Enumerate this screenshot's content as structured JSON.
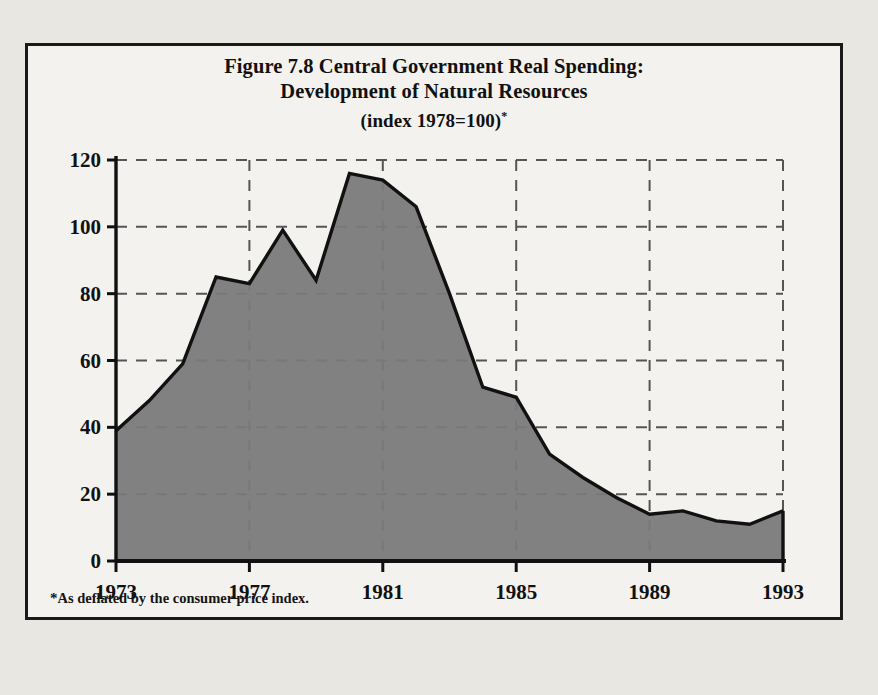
{
  "figure": {
    "title_line1": "Figure 7.8 Central Government Real Spending:",
    "title_line2": "Development of Natural Resources",
    "title_line3": "(index 1978=100)",
    "title_marker": "*",
    "footnote_marker": "*",
    "footnote_text": "As deflated by the consumer price index."
  },
  "colors": {
    "page_background": "#e9e7e2",
    "figure_background": "#f4f2ee",
    "frame_border": "#1a1a1a",
    "area_fill": "#7a7a7a",
    "line_stroke": "#111111",
    "grid_stroke": "#555555",
    "axis_stroke": "#111111",
    "text": "#111111"
  },
  "chart_data": {
    "type": "area",
    "title": "Figure 7.8 Central Government Real Spending: Development of Natural Resources (index 1978=100)",
    "subtitle": "(index 1978=100)",
    "xlabel": "",
    "ylabel": "",
    "xlim": [
      1973,
      1993
    ],
    "ylim": [
      0,
      120
    ],
    "yticks": [
      0,
      20,
      40,
      60,
      80,
      100,
      120
    ],
    "ytick_labels": [
      "0",
      "20",
      "40",
      "60",
      "80",
      "100",
      "120"
    ],
    "xticks": [
      1973,
      1977,
      1981,
      1985,
      1989,
      1993
    ],
    "xtick_labels": [
      "1973",
      "1977",
      "1981",
      "1985",
      "1989",
      "1993"
    ],
    "grid": "dashed-both",
    "legend": "none",
    "annotations": [
      "As deflated by the consumer price index."
    ],
    "x": [
      1973,
      1974,
      1975,
      1976,
      1977,
      1978,
      1979,
      1980,
      1981,
      1982,
      1983,
      1984,
      1985,
      1986,
      1987,
      1988,
      1989,
      1990,
      1991,
      1992,
      1993
    ],
    "values": [
      39,
      48,
      59,
      85,
      83,
      99,
      84,
      116,
      114,
      106,
      80,
      52,
      49,
      32,
      25,
      19,
      14,
      15,
      12,
      11,
      15
    ],
    "series": [
      {
        "name": "Development of Natural Resources (real spending index)",
        "values": [
          39,
          48,
          59,
          85,
          83,
          99,
          84,
          116,
          114,
          106,
          80,
          52,
          49,
          32,
          25,
          19,
          14,
          15,
          12,
          11,
          15
        ]
      }
    ]
  }
}
